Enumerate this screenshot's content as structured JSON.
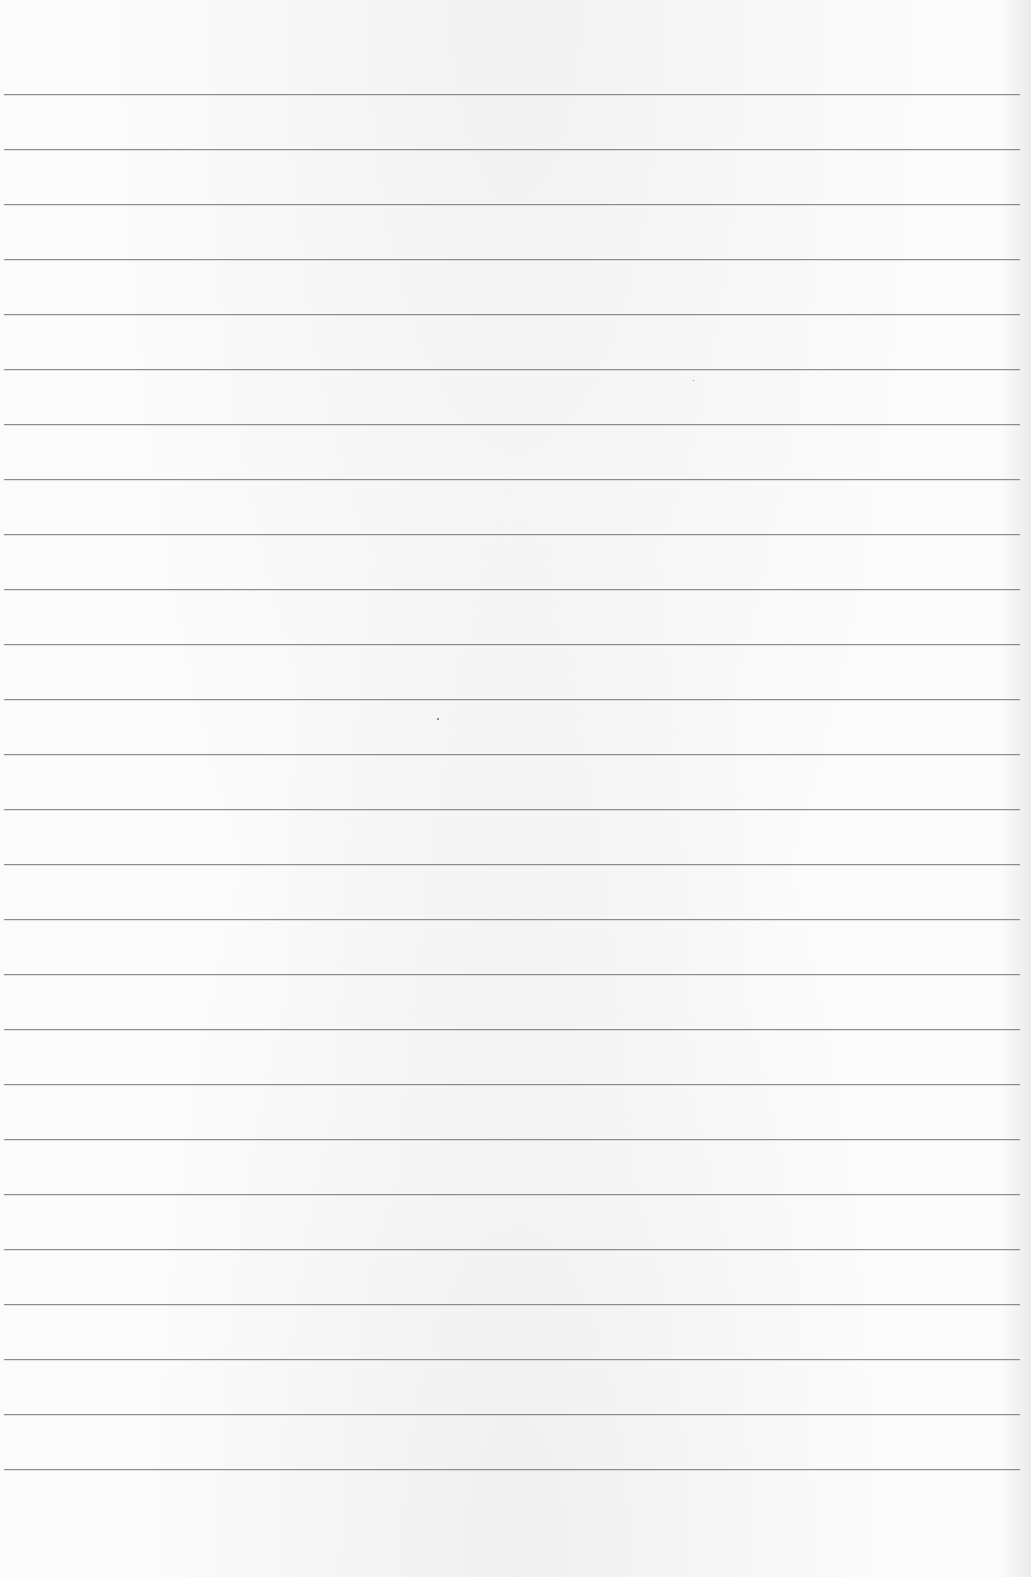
{
  "page": {
    "type": "blank-ruled-sheet",
    "background_color": "#fbfbfb",
    "rule_color": "#8c8c8c",
    "rules": {
      "count": 26,
      "first_y": 94,
      "spacing": 55,
      "x_start": 4,
      "x_end": 1020,
      "thickness": 1
    },
    "text_content": []
  }
}
